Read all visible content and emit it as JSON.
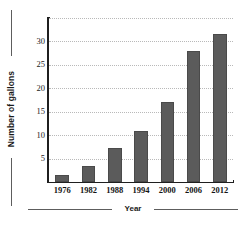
{
  "chart_data": {
    "type": "bar",
    "title": "",
    "xlabel": "Year",
    "ylabel": "Number of gallons",
    "categories": [
      "1976",
      "1982",
      "1988",
      "1994",
      "2000",
      "2006",
      "2012"
    ],
    "values": [
      1.5,
      3.5,
      7.3,
      10.8,
      17,
      28,
      31.5
    ],
    "ytick_labels": [
      "30",
      "25",
      "20",
      "15",
      "10",
      "5"
    ],
    "ytick_values": [
      30,
      25,
      20,
      15,
      10,
      5
    ],
    "ylim": [
      0,
      35
    ],
    "xlim_note": "categorical",
    "grid": "horizontal dotted gridlines",
    "legend": "none",
    "bar_color": "#5b5b5b",
    "axis_color": "#1f1f1f",
    "gridline_color": "#b9b9b9",
    "background": "#ffffff"
  }
}
